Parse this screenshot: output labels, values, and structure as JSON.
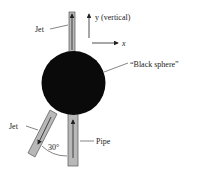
{
  "diagram": {
    "labels": {
      "jet_top": "Jet",
      "jet_bottom": "Jet",
      "y_axis": "y (vertical)",
      "x_axis": "x",
      "sphere": "“Black sphere”",
      "pipe": "Pipe",
      "angle": "30°"
    },
    "colors": {
      "sphere": "#0a0a0a",
      "pipe_fill": "#b8b8b8",
      "stroke": "#333333",
      "background": "#ffffff"
    }
  }
}
